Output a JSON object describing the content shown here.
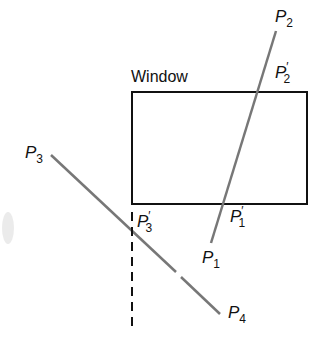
{
  "diagram": {
    "window_label": "Window",
    "points": {
      "P1": {
        "base": "P",
        "sub": "1",
        "prime": false
      },
      "P2": {
        "base": "P",
        "sub": "2",
        "prime": false
      },
      "P3": {
        "base": "P",
        "sub": "3",
        "prime": false
      },
      "P4": {
        "base": "P",
        "sub": "4",
        "prime": false
      },
      "P1p": {
        "base": "P",
        "sub": "1",
        "prime": true
      },
      "P2p": {
        "base": "P",
        "sub": "2",
        "prime": true
      },
      "P3p": {
        "base": "P",
        "sub": "3",
        "prime": true
      }
    },
    "prime_mark": "′",
    "colors": {
      "line": "#777777",
      "window": "#111111",
      "text": "#111111"
    }
  }
}
